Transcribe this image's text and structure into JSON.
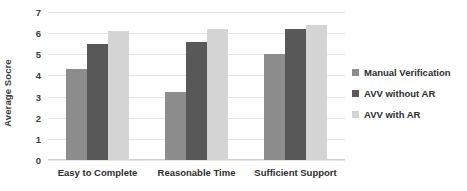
{
  "chart_data": {
    "type": "bar",
    "title": "",
    "subtitle": "",
    "xlabel": "",
    "ylabel": "Average Socre",
    "ylim": [
      0,
      7
    ],
    "ytick_step": 1,
    "yticks": [
      "7",
      "6",
      "5",
      "4",
      "3",
      "2",
      "1",
      "0"
    ],
    "grid": true,
    "legend_position": "right",
    "categories": [
      "Easy to Complete",
      "Reasonable Time",
      "Sufficient Support"
    ],
    "series": [
      {
        "name": "Manual Verification",
        "color": "#8d8d8d",
        "values": [
          4.3,
          3.2,
          5.0
        ]
      },
      {
        "name": "AVV without AR",
        "color": "#585858",
        "values": [
          5.5,
          5.6,
          6.2
        ]
      },
      {
        "name": "AVV with AR",
        "color": "#d4d4d4",
        "values": [
          6.1,
          6.2,
          6.4
        ]
      }
    ]
  },
  "legend": {
    "items": [
      {
        "label": "Manual Verification",
        "color": "#8d8d8d"
      },
      {
        "label": "AVV without AR",
        "color": "#585858"
      },
      {
        "label": "AVV with AR",
        "color": "#d4d4d4"
      }
    ]
  }
}
